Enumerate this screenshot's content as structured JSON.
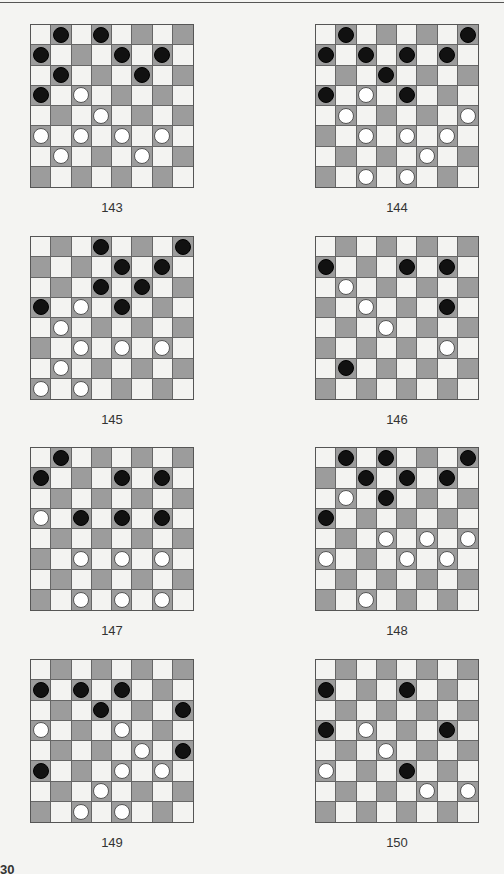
{
  "page": {
    "page_number_partial": "30"
  },
  "puzzles": [
    {
      "number": "143",
      "pieces": [
        {
          "r": 0,
          "c": 1,
          "color": "black"
        },
        {
          "r": 0,
          "c": 3,
          "color": "black"
        },
        {
          "r": 1,
          "c": 0,
          "color": "black"
        },
        {
          "r": 1,
          "c": 4,
          "color": "black"
        },
        {
          "r": 1,
          "c": 6,
          "color": "black"
        },
        {
          "r": 2,
          "c": 1,
          "color": "black"
        },
        {
          "r": 2,
          "c": 5,
          "color": "black"
        },
        {
          "r": 3,
          "c": 0,
          "color": "black"
        },
        {
          "r": 3,
          "c": 2,
          "color": "white"
        },
        {
          "r": 4,
          "c": 3,
          "color": "white"
        },
        {
          "r": 5,
          "c": 0,
          "color": "white"
        },
        {
          "r": 5,
          "c": 2,
          "color": "white"
        },
        {
          "r": 5,
          "c": 4,
          "color": "white"
        },
        {
          "r": 5,
          "c": 6,
          "color": "white"
        },
        {
          "r": 6,
          "c": 1,
          "color": "white"
        },
        {
          "r": 6,
          "c": 5,
          "color": "white"
        }
      ]
    },
    {
      "number": "144",
      "pieces": [
        {
          "r": 0,
          "c": 1,
          "color": "black"
        },
        {
          "r": 0,
          "c": 7,
          "color": "black"
        },
        {
          "r": 1,
          "c": 0,
          "color": "black"
        },
        {
          "r": 1,
          "c": 2,
          "color": "black"
        },
        {
          "r": 1,
          "c": 4,
          "color": "black"
        },
        {
          "r": 1,
          "c": 6,
          "color": "black"
        },
        {
          "r": 2,
          "c": 3,
          "color": "black"
        },
        {
          "r": 3,
          "c": 0,
          "color": "black"
        },
        {
          "r": 3,
          "c": 2,
          "color": "white"
        },
        {
          "r": 3,
          "c": 4,
          "color": "black"
        },
        {
          "r": 4,
          "c": 1,
          "color": "white"
        },
        {
          "r": 4,
          "c": 7,
          "color": "white"
        },
        {
          "r": 5,
          "c": 2,
          "color": "white"
        },
        {
          "r": 5,
          "c": 4,
          "color": "white"
        },
        {
          "r": 5,
          "c": 6,
          "color": "white"
        },
        {
          "r": 6,
          "c": 5,
          "color": "white"
        },
        {
          "r": 7,
          "c": 2,
          "color": "white"
        },
        {
          "r": 7,
          "c": 4,
          "color": "white"
        }
      ]
    },
    {
      "number": "145",
      "pieces": [
        {
          "r": 0,
          "c": 3,
          "color": "black"
        },
        {
          "r": 0,
          "c": 7,
          "color": "black"
        },
        {
          "r": 1,
          "c": 4,
          "color": "black"
        },
        {
          "r": 1,
          "c": 6,
          "color": "black"
        },
        {
          "r": 2,
          "c": 3,
          "color": "black"
        },
        {
          "r": 2,
          "c": 5,
          "color": "black"
        },
        {
          "r": 3,
          "c": 0,
          "color": "black"
        },
        {
          "r": 3,
          "c": 2,
          "color": "white"
        },
        {
          "r": 3,
          "c": 4,
          "color": "black"
        },
        {
          "r": 4,
          "c": 1,
          "color": "white"
        },
        {
          "r": 5,
          "c": 2,
          "color": "white"
        },
        {
          "r": 5,
          "c": 4,
          "color": "white"
        },
        {
          "r": 5,
          "c": 6,
          "color": "white"
        },
        {
          "r": 6,
          "c": 1,
          "color": "white"
        },
        {
          "r": 7,
          "c": 0,
          "color": "white"
        },
        {
          "r": 7,
          "c": 2,
          "color": "white"
        }
      ]
    },
    {
      "number": "146",
      "pieces": [
        {
          "r": 1,
          "c": 0,
          "color": "black"
        },
        {
          "r": 1,
          "c": 4,
          "color": "black"
        },
        {
          "r": 1,
          "c": 6,
          "color": "black"
        },
        {
          "r": 2,
          "c": 1,
          "color": "white"
        },
        {
          "r": 3,
          "c": 2,
          "color": "white"
        },
        {
          "r": 3,
          "c": 6,
          "color": "black"
        },
        {
          "r": 4,
          "c": 3,
          "color": "white"
        },
        {
          "r": 5,
          "c": 6,
          "color": "white"
        },
        {
          "r": 6,
          "c": 1,
          "color": "black"
        }
      ]
    },
    {
      "number": "147",
      "pieces": [
        {
          "r": 0,
          "c": 1,
          "color": "black"
        },
        {
          "r": 1,
          "c": 0,
          "color": "black"
        },
        {
          "r": 1,
          "c": 4,
          "color": "black"
        },
        {
          "r": 1,
          "c": 6,
          "color": "black"
        },
        {
          "r": 3,
          "c": 0,
          "color": "white"
        },
        {
          "r": 3,
          "c": 2,
          "color": "black"
        },
        {
          "r": 3,
          "c": 4,
          "color": "black"
        },
        {
          "r": 3,
          "c": 6,
          "color": "black"
        },
        {
          "r": 5,
          "c": 2,
          "color": "white"
        },
        {
          "r": 5,
          "c": 4,
          "color": "white"
        },
        {
          "r": 5,
          "c": 6,
          "color": "white"
        },
        {
          "r": 7,
          "c": 2,
          "color": "white"
        },
        {
          "r": 7,
          "c": 4,
          "color": "white"
        },
        {
          "r": 7,
          "c": 6,
          "color": "white"
        }
      ]
    },
    {
      "number": "148",
      "pieces": [
        {
          "r": 0,
          "c": 1,
          "color": "black"
        },
        {
          "r": 0,
          "c": 3,
          "color": "black"
        },
        {
          "r": 0,
          "c": 7,
          "color": "black"
        },
        {
          "r": 1,
          "c": 2,
          "color": "black"
        },
        {
          "r": 1,
          "c": 4,
          "color": "black"
        },
        {
          "r": 1,
          "c": 6,
          "color": "black"
        },
        {
          "r": 2,
          "c": 1,
          "color": "white"
        },
        {
          "r": 2,
          "c": 3,
          "color": "black"
        },
        {
          "r": 3,
          "c": 0,
          "color": "black"
        },
        {
          "r": 4,
          "c": 3,
          "color": "white"
        },
        {
          "r": 4,
          "c": 5,
          "color": "white"
        },
        {
          "r": 4,
          "c": 7,
          "color": "white"
        },
        {
          "r": 5,
          "c": 0,
          "color": "white"
        },
        {
          "r": 5,
          "c": 4,
          "color": "white"
        },
        {
          "r": 5,
          "c": 6,
          "color": "white"
        },
        {
          "r": 7,
          "c": 2,
          "color": "white"
        }
      ]
    },
    {
      "number": "149",
      "pieces": [
        {
          "r": 1,
          "c": 0,
          "color": "black"
        },
        {
          "r": 1,
          "c": 2,
          "color": "black"
        },
        {
          "r": 1,
          "c": 4,
          "color": "black"
        },
        {
          "r": 2,
          "c": 3,
          "color": "black"
        },
        {
          "r": 2,
          "c": 7,
          "color": "black"
        },
        {
          "r": 3,
          "c": 0,
          "color": "white"
        },
        {
          "r": 3,
          "c": 4,
          "color": "white"
        },
        {
          "r": 4,
          "c": 5,
          "color": "white"
        },
        {
          "r": 4,
          "c": 7,
          "color": "black"
        },
        {
          "r": 5,
          "c": 0,
          "color": "black"
        },
        {
          "r": 5,
          "c": 4,
          "color": "white"
        },
        {
          "r": 5,
          "c": 6,
          "color": "white"
        },
        {
          "r": 6,
          "c": 3,
          "color": "white"
        },
        {
          "r": 7,
          "c": 2,
          "color": "white"
        },
        {
          "r": 7,
          "c": 4,
          "color": "white"
        }
      ]
    },
    {
      "number": "150",
      "pieces": [
        {
          "r": 1,
          "c": 0,
          "color": "black"
        },
        {
          "r": 1,
          "c": 4,
          "color": "black"
        },
        {
          "r": 3,
          "c": 0,
          "color": "black"
        },
        {
          "r": 3,
          "c": 2,
          "color": "white"
        },
        {
          "r": 3,
          "c": 6,
          "color": "black"
        },
        {
          "r": 4,
          "c": 3,
          "color": "white"
        },
        {
          "r": 5,
          "c": 0,
          "color": "white"
        },
        {
          "r": 5,
          "c": 4,
          "color": "black"
        },
        {
          "r": 6,
          "c": 5,
          "color": "white"
        },
        {
          "r": 6,
          "c": 7,
          "color": "white"
        }
      ]
    }
  ]
}
